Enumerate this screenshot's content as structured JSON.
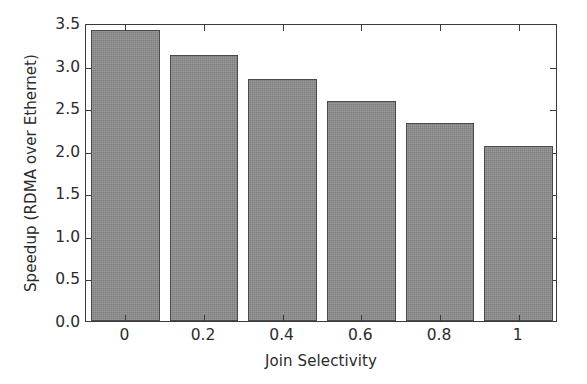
{
  "chart_data": {
    "type": "bar",
    "title": "",
    "xlabel": "Join Selectivity",
    "ylabel": "Speedup (RDMA over Ethernet)",
    "categories": [
      "0",
      "0.2",
      "0.4",
      "0.6",
      "0.8",
      "1"
    ],
    "values": [
      3.42,
      3.13,
      2.84,
      2.58,
      2.33,
      2.06
    ],
    "ylim": [
      0.0,
      3.5
    ],
    "yticks": [
      "0.0",
      "0.5",
      "1.0",
      "1.5",
      "2.0",
      "2.5",
      "3.0",
      "3.5"
    ],
    "ytick_values": [
      0.0,
      0.5,
      1.0,
      1.5,
      2.0,
      2.5,
      3.0,
      3.5
    ],
    "grid": false,
    "legend": null,
    "bar_color": "#8d8d8d",
    "bar_edge_color": "#4a4a4a",
    "axis_color": "#3a3a3a",
    "background": "#ffffff"
  }
}
